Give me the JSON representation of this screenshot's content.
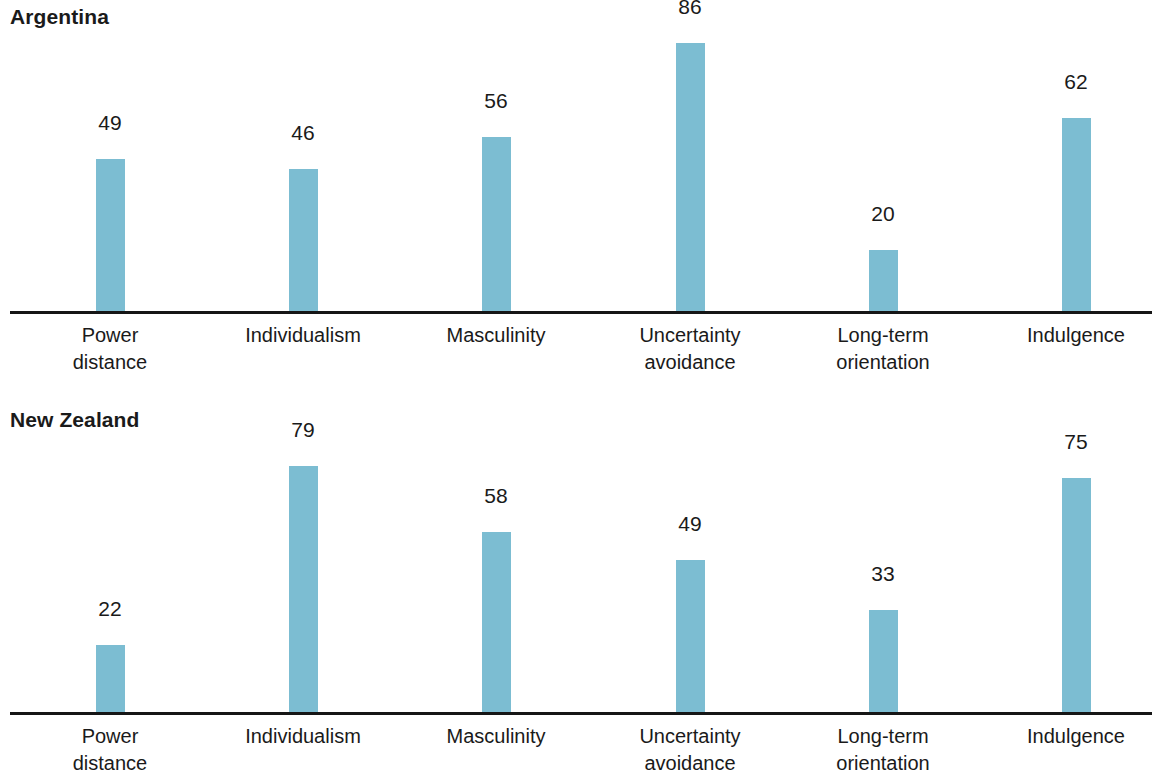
{
  "chart_data": [
    {
      "type": "bar",
      "title": "Argentina",
      "xlabel": "",
      "ylabel": "",
      "ylim": [
        0,
        100
      ],
      "grid": false,
      "legend": false,
      "bar_color": "#7cbdd2",
      "axis_color": "#161616",
      "categories": [
        "Power distance",
        "Individualism",
        "Masculinity",
        "Uncertainty avoidance",
        "Long-term orientation",
        "Indulgence"
      ],
      "category_lines": [
        [
          "Power",
          "distance"
        ],
        [
          "Individualism",
          ""
        ],
        [
          "Masculinity",
          ""
        ],
        [
          "Uncertainty",
          "avoidance"
        ],
        [
          "Long-term",
          "orientation"
        ],
        [
          "Indulgence",
          ""
        ]
      ],
      "values": [
        49,
        46,
        56,
        86,
        20,
        62
      ],
      "value_labels": [
        "49",
        "46",
        "56",
        "86",
        "20",
        "62"
      ]
    },
    {
      "type": "bar",
      "title": "New Zealand",
      "xlabel": "",
      "ylabel": "",
      "ylim": [
        0,
        100
      ],
      "grid": false,
      "legend": false,
      "bar_color": "#7cbdd2",
      "axis_color": "#161616",
      "categories": [
        "Power distance",
        "Individualism",
        "Masculinity",
        "Uncertainty avoidance",
        "Long-term orientation",
        "Indulgence"
      ],
      "category_lines": [
        [
          "Power",
          "distance"
        ],
        [
          "Individualism",
          ""
        ],
        [
          "Masculinity",
          ""
        ],
        [
          "Uncertainty",
          "avoidance"
        ],
        [
          "Long-term",
          "orientation"
        ],
        [
          "Indulgence",
          ""
        ]
      ],
      "values": [
        22,
        79,
        58,
        49,
        33,
        75
      ],
      "value_labels": [
        "22",
        "79",
        "58",
        "49",
        "33",
        "75"
      ]
    }
  ]
}
